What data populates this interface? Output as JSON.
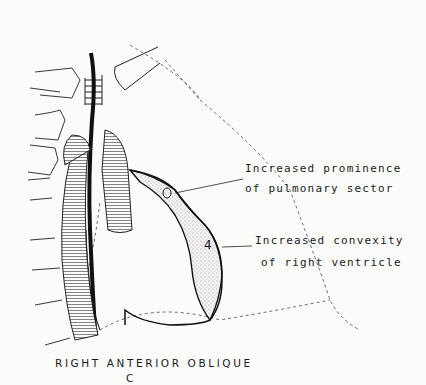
{
  "diagram": {
    "view_title": "RIGHT ANTERIOR OBLIQUE",
    "panel_letter": "C",
    "annotations": [
      {
        "line1": "Increased prominence",
        "line2": "of pulmonary sector",
        "marker": "3"
      },
      {
        "line1": "Increased convexity",
        "line2": "of right ventricle",
        "marker": "4"
      }
    ],
    "colors": {
      "ink": "#1a1a1a",
      "paper": "#fbfbfa",
      "stipple": "#cfcfcf"
    }
  }
}
